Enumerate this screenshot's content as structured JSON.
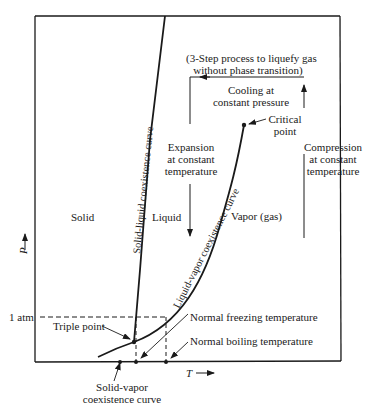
{
  "diagram": {
    "type": "phase-diagram",
    "axes": {
      "y_label": "P",
      "x_label": "T",
      "y_tick": "1 atm"
    },
    "regions": {
      "solid": "Solid",
      "liquid": "Liquid",
      "vapor": "Vapor (gas)"
    },
    "curves": {
      "solid_liquid": "Solid-liquid coexistence curve",
      "liquid_vapor": "Liquid-vapor coexistence curve",
      "solid_vapor_line1": "Solid-vapor",
      "solid_vapor_line2": "coexistence curve"
    },
    "points": {
      "triple": "Triple point",
      "critical_line1": "Critical",
      "critical_line2": "point",
      "normal_freezing": "Normal freezing temperature",
      "normal_boiling": "Normal boiling temperature"
    },
    "process": {
      "title_line1": "(3-Step process to liquefy gas",
      "title_line2": "without phase transition)",
      "cooling_line1": "Cooling at",
      "cooling_line2": "constant pressure",
      "expansion_line1": "Expansion",
      "expansion_line2": "at constant",
      "expansion_line3": "temperature",
      "compression_line1": "Compression",
      "compression_line2": "at constant",
      "compression_line3": "temperature"
    },
    "colors": {
      "line": "#1a1a1a",
      "background": "#ffffff"
    }
  }
}
